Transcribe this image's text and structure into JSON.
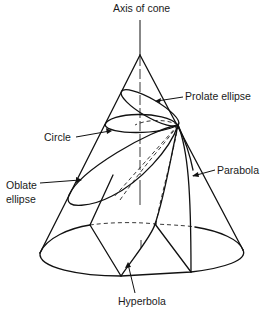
{
  "diagram": {
    "labels": {
      "axis": "Axis of cone",
      "prolate": "Prolate ellipse",
      "circle": "Circle",
      "oblate_line1": "Oblate",
      "oblate_line2": "ellipse",
      "parabola": "Parabola",
      "hyperbola": "Hyperbola"
    },
    "colors": {
      "line": "#111111",
      "background": "#ffffff"
    }
  }
}
